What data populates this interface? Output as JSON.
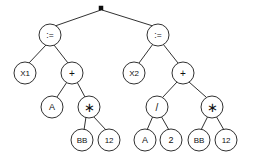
{
  "figure": {
    "name": "expression-tree",
    "background_color": "#ffffff",
    "line_color": "#1a1a1a",
    "text_color": "#101010",
    "width": 254,
    "height": 160
  },
  "root": {
    "shape": "filled-square",
    "label": "",
    "x": 101,
    "y": 8,
    "size": 4
  },
  "nodes": [
    {
      "id": "assign-left",
      "label": ":=",
      "x": 50,
      "y": 35,
      "r": 11,
      "style": "lbl-assign"
    },
    {
      "id": "assign-right",
      "label": ":=",
      "x": 158,
      "y": 35,
      "r": 11,
      "style": "lbl-assign"
    },
    {
      "id": "var-x1",
      "label": "X1",
      "x": 25,
      "y": 73,
      "r": 11,
      "style": "lbl-wide"
    },
    {
      "id": "plus-left",
      "label": "+",
      "x": 72,
      "y": 73,
      "r": 11,
      "style": "lbl-op"
    },
    {
      "id": "var-x2",
      "label": "X2",
      "x": 134,
      "y": 73,
      "r": 11,
      "style": "lbl-wide"
    },
    {
      "id": "plus-right",
      "label": "+",
      "x": 183,
      "y": 73,
      "r": 11,
      "style": "lbl-op"
    },
    {
      "id": "var-a-left",
      "label": "A",
      "x": 52,
      "y": 107,
      "r": 11,
      "style": ""
    },
    {
      "id": "times-left",
      "label": "∗",
      "x": 89,
      "y": 107,
      "r": 11,
      "style": "lbl-star"
    },
    {
      "id": "divide",
      "label": "/",
      "x": 157,
      "y": 107,
      "r": 11,
      "style": "lbl-op"
    },
    {
      "id": "times-right",
      "label": "∗",
      "x": 212,
      "y": 107,
      "r": 11,
      "style": "lbl-star"
    },
    {
      "id": "var-bb-left",
      "label": "BB",
      "x": 82,
      "y": 140,
      "r": 11,
      "style": "lbl-wide"
    },
    {
      "id": "num-12-left",
      "label": "12",
      "x": 109,
      "y": 140,
      "r": 11,
      "style": "lbl-wide"
    },
    {
      "id": "var-a-right",
      "label": "A",
      "x": 145,
      "y": 140,
      "r": 11,
      "style": ""
    },
    {
      "id": "num-2",
      "label": "2",
      "x": 171,
      "y": 140,
      "r": 11,
      "style": ""
    },
    {
      "id": "var-bb-right",
      "label": "BB",
      "x": 199,
      "y": 140,
      "r": 11,
      "style": "lbl-wide"
    },
    {
      "id": "num-12-right",
      "label": "12",
      "x": 226,
      "y": 140,
      "r": 11,
      "style": "lbl-wide"
    }
  ],
  "edges": [
    {
      "from": "root",
      "to": "assign-left",
      "x1": 101,
      "y1": 10,
      "x2": 55,
      "y2": 26
    },
    {
      "from": "root",
      "to": "assign-right",
      "x1": 102,
      "y1": 10,
      "x2": 153,
      "y2": 26
    },
    {
      "from": "assign-left",
      "to": "var-x1",
      "x1": 46,
      "y1": 45,
      "x2": 29,
      "y2": 63
    },
    {
      "from": "assign-left",
      "to": "plus-left",
      "x1": 54,
      "y1": 45,
      "x2": 68,
      "y2": 63
    },
    {
      "from": "assign-right",
      "to": "var-x2",
      "x1": 153,
      "y1": 44,
      "x2": 139,
      "y2": 63
    },
    {
      "from": "assign-right",
      "to": "plus-right",
      "x1": 163,
      "y1": 44,
      "x2": 178,
      "y2": 63
    },
    {
      "from": "plus-left",
      "to": "var-a-left",
      "x1": 67,
      "y1": 82,
      "x2": 57,
      "y2": 97
    },
    {
      "from": "plus-left",
      "to": "times-left",
      "x1": 77,
      "y1": 82,
      "x2": 85,
      "y2": 97
    },
    {
      "from": "plus-right",
      "to": "divide",
      "x1": 177,
      "y1": 82,
      "x2": 163,
      "y2": 97
    },
    {
      "from": "plus-right",
      "to": "times-right",
      "x1": 189,
      "y1": 82,
      "x2": 206,
      "y2": 97
    },
    {
      "from": "times-left",
      "to": "var-bb-left",
      "x1": 86,
      "y1": 117,
      "x2": 84,
      "y2": 130
    },
    {
      "from": "times-left",
      "to": "num-12-left",
      "x1": 93,
      "y1": 116,
      "x2": 106,
      "y2": 130
    },
    {
      "from": "divide",
      "to": "var-a-right",
      "x1": 153,
      "y1": 116,
      "x2": 147,
      "y2": 130
    },
    {
      "from": "divide",
      "to": "num-2",
      "x1": 161,
      "y1": 116,
      "x2": 169,
      "y2": 130
    },
    {
      "from": "times-right",
      "to": "var-bb-right",
      "x1": 208,
      "y1": 116,
      "x2": 201,
      "y2": 130
    },
    {
      "from": "times-right",
      "to": "num-12-right",
      "x1": 216,
      "y1": 116,
      "x2": 224,
      "y2": 130
    }
  ],
  "chart_data": {
    "type": "diagram",
    "title": "",
    "structure": "binary-expression-tree",
    "tree": {
      "label": "■",
      "children": [
        {
          "label": ":=",
          "children": [
            {
              "label": "X1",
              "children": []
            },
            {
              "label": "+",
              "children": [
                {
                  "label": "A",
                  "children": []
                },
                {
                  "label": "*",
                  "children": [
                    {
                      "label": "BB",
                      "children": []
                    },
                    {
                      "label": "12",
                      "children": []
                    }
                  ]
                }
              ]
            }
          ]
        },
        {
          "label": ":=",
          "children": [
            {
              "label": "X2",
              "children": []
            },
            {
              "label": "+",
              "children": [
                {
                  "label": "/",
                  "children": [
                    {
                      "label": "A",
                      "children": []
                    },
                    {
                      "label": "2",
                      "children": []
                    }
                  ]
                },
                {
                  "label": "*",
                  "children": [
                    {
                      "label": "BB",
                      "children": []
                    },
                    {
                      "label": "12",
                      "children": []
                    }
                  ]
                }
              ]
            }
          ]
        }
      ]
    }
  }
}
